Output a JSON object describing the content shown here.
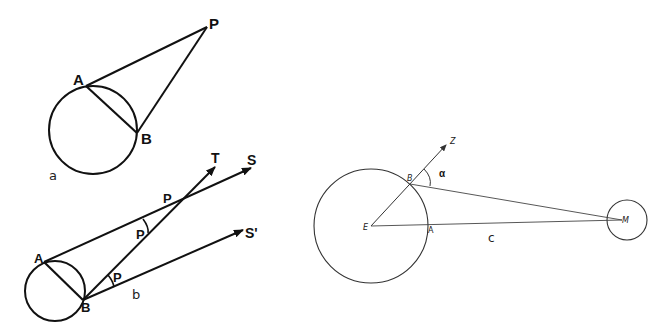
{
  "figure": {
    "panels": [
      {
        "id": "a",
        "caption": "a",
        "labels": {
          "A": "A",
          "B": "B",
          "P": "P"
        },
        "elements": [
          "circle",
          "chord AB",
          "line A-P",
          "line B-P"
        ]
      },
      {
        "id": "b",
        "caption": "b",
        "labels": {
          "A": "A",
          "B": "B",
          "T": "T",
          "S": "S",
          "S_prime": "S'",
          "p_upper": "P",
          "p_mid": "P",
          "p_lower": "P"
        },
        "elements": [
          "circle",
          "chord AB",
          "ray A-S",
          "ray B-T",
          "ray B-S'",
          "angle arc at intersection",
          "angle arc at B"
        ]
      },
      {
        "id": "c",
        "caption": "c",
        "labels": {
          "E": "E",
          "A": "A",
          "B": "B",
          "Z": "Z",
          "M": "M",
          "alpha": "α"
        },
        "elements": [
          "earth circle",
          "moon circle",
          "ray E-Z through B",
          "line B-M",
          "line E-M",
          "angle arc alpha"
        ]
      }
    ]
  }
}
